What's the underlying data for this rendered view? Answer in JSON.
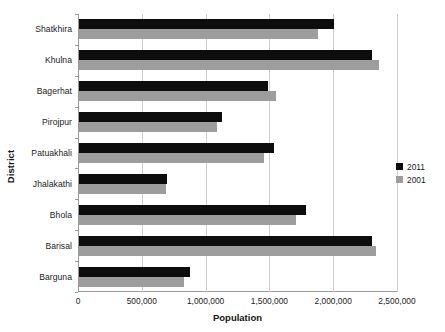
{
  "chart_data": {
    "type": "bar",
    "orientation": "horizontal",
    "title": "",
    "xlabel": "Population",
    "ylabel": "District",
    "categories": [
      "Shatkhira",
      "Khulna",
      "Bagerhat",
      "Pirojpur",
      "Patuakhali",
      "Jhalakathi",
      "Bhola",
      "Barisal",
      "Barguna"
    ],
    "series": [
      {
        "name": "2011",
        "color": "#0d0d0d",
        "values": [
          2000000,
          2300000,
          1480000,
          1120000,
          1530000,
          690000,
          1780000,
          2300000,
          870000
        ]
      },
      {
        "name": "2001",
        "color": "#9d9d9d",
        "values": [
          1870000,
          2350000,
          1540000,
          1080000,
          1450000,
          680000,
          1700000,
          2330000,
          820000
        ]
      }
    ],
    "xlim": [
      0,
      2500000
    ],
    "xticks": [
      0,
      500000,
      1000000,
      1500000,
      2000000,
      2500000
    ],
    "xtick_labels": [
      "0",
      "500,000",
      "1,000,000",
      "1,500,000",
      "2,000,000",
      "2,500,000"
    ],
    "grid": "vertical",
    "legend_position": "right"
  },
  "legend": {
    "entries": [
      {
        "label": "2011",
        "color": "#0d0d0d"
      },
      {
        "label": "2001",
        "color": "#9d9d9d"
      }
    ]
  }
}
